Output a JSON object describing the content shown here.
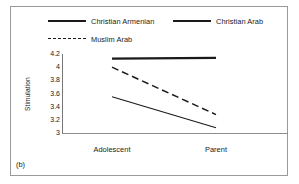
{
  "figure": {
    "panel_label": "(b)"
  },
  "legend": {
    "entries": [
      {
        "label": "Christian Armenian",
        "style": "solid-thick",
        "swatch_name": "legend-swatch-christian-armenian"
      },
      {
        "label": "Christian Arab",
        "style": "solid-thin",
        "swatch_name": "legend-swatch-christian-arab"
      },
      {
        "label": "Muslim Arab",
        "style": "dashed",
        "swatch_name": "legend-swatch-muslim-arab"
      }
    ]
  },
  "axes": {
    "y_title": "Stimulation",
    "y_ticks": [
      "4.2",
      "4",
      "3.8",
      "3.6",
      "3.4",
      "3.2",
      "3"
    ],
    "x_ticks": [
      "Adolescent",
      "Parent"
    ]
  },
  "chart_data": {
    "type": "line",
    "title": "",
    "xlabel": "",
    "ylabel": "Stimulation",
    "categories": [
      "Adolescent",
      "Parent"
    ],
    "ylim": [
      3.0,
      4.2
    ],
    "ytick_values": [
      4.2,
      4.0,
      3.8,
      3.6,
      3.4,
      3.2,
      3.0
    ],
    "grid": false,
    "legend_position": "top",
    "series": [
      {
        "name": "Christian Armenian",
        "values": [
          4.13,
          4.14
        ],
        "line_style": "solid",
        "line_width": "thick",
        "color": "#1a1a1a"
      },
      {
        "name": "Muslim Arab",
        "values": [
          4.0,
          3.28
        ],
        "line_style": "dashed",
        "line_width": "medium",
        "color": "#1a1a1a"
      },
      {
        "name": "Christian Arab",
        "values": [
          3.55,
          3.08
        ],
        "line_style": "solid",
        "line_width": "thin",
        "color": "#1a1a1a"
      }
    ],
    "annotations": [
      "(b)"
    ]
  }
}
